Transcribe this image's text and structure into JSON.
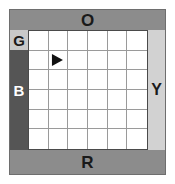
{
  "board": {
    "name": "compass-grid-board",
    "grid": {
      "rows": 6,
      "cols": 6,
      "cell_background": "#ffffff",
      "line_color": "#9a9a9a"
    },
    "frame_color": "#6e6e6e",
    "background": "#ffffff"
  },
  "edges": {
    "top": {
      "label": "O",
      "background": "#8c8c8c",
      "text_color": "#1a1a1a"
    },
    "bottom": {
      "label": "R",
      "background": "#8c8c8c",
      "text_color": "#1a1a1a"
    },
    "left_corner": {
      "label": "G",
      "background": "#c9c9c9",
      "text_color": "#1a1a1a"
    },
    "left": {
      "label": "B",
      "background": "#555555",
      "text_color": "#ffffff"
    },
    "right": {
      "label": "Y",
      "background": "#d2d2d2",
      "text_color": "#1a1a1a"
    }
  },
  "marker": {
    "name": "arrow-east",
    "glyph": "right-triangle",
    "color": "#111111",
    "row": 2,
    "col": 2,
    "heading": "east"
  },
  "cells": [
    [
      "",
      "",
      "",
      "",
      "",
      ""
    ],
    [
      "",
      "arrow-east",
      "",
      "",
      "",
      ""
    ],
    [
      "",
      "",
      "",
      "",
      "",
      ""
    ],
    [
      "",
      "",
      "",
      "",
      "",
      ""
    ],
    [
      "",
      "",
      "",
      "",
      "",
      ""
    ],
    [
      "",
      "",
      "",
      "",
      "",
      ""
    ]
  ]
}
